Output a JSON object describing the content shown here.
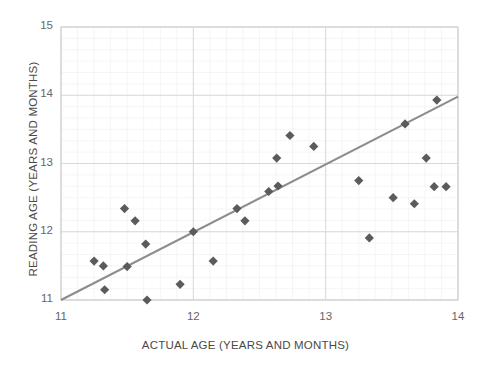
{
  "chart_data": {
    "type": "scatter",
    "title": "",
    "xlabel": "ACTUAL AGE (YEARS AND MONTHS)",
    "ylabel": "READING AGE (YEARS AND MONTHS)",
    "xlim": [
      11,
      14
    ],
    "ylim": [
      11,
      15
    ],
    "xticks": [
      "11",
      "12",
      "13",
      "14"
    ],
    "yticks": [
      "11",
      "12",
      "13",
      "14",
      "15"
    ],
    "xtick_values": [
      11,
      12,
      13,
      14
    ],
    "ytick_values": [
      11,
      12,
      13,
      14,
      15
    ],
    "grid": true,
    "minor_grid": true,
    "legend": "none",
    "marker": "diamond",
    "marker_color": "#5b5b5b",
    "trendline_color": "#8c8c8c",
    "gridline_color": "#d9d9d9",
    "minor_gridline_color": "#f0f0f0",
    "points": [
      {
        "x": 11.25,
        "y": 11.57
      },
      {
        "x": 11.32,
        "y": 11.5
      },
      {
        "x": 11.33,
        "y": 11.15
      },
      {
        "x": 11.48,
        "y": 12.34
      },
      {
        "x": 11.5,
        "y": 11.49
      },
      {
        "x": 11.56,
        "y": 12.16
      },
      {
        "x": 11.64,
        "y": 11.82
      },
      {
        "x": 11.65,
        "y": 11.0
      },
      {
        "x": 11.9,
        "y": 11.23
      },
      {
        "x": 12.0,
        "y": 12.0
      },
      {
        "x": 12.15,
        "y": 11.57
      },
      {
        "x": 12.33,
        "y": 12.34
      },
      {
        "x": 12.39,
        "y": 12.16
      },
      {
        "x": 12.57,
        "y": 12.59
      },
      {
        "x": 12.64,
        "y": 12.67
      },
      {
        "x": 12.63,
        "y": 13.08
      },
      {
        "x": 12.73,
        "y": 13.41
      },
      {
        "x": 12.91,
        "y": 13.25
      },
      {
        "x": 13.25,
        "y": 12.75
      },
      {
        "x": 13.33,
        "y": 11.91
      },
      {
        "x": 13.51,
        "y": 12.5
      },
      {
        "x": 13.6,
        "y": 13.58
      },
      {
        "x": 13.67,
        "y": 12.41
      },
      {
        "x": 13.76,
        "y": 13.08
      },
      {
        "x": 13.82,
        "y": 12.66
      },
      {
        "x": 13.84,
        "y": 13.93
      },
      {
        "x": 13.91,
        "y": 12.66
      }
    ],
    "trendline": {
      "x0": 11.0,
      "y0": 11.0,
      "x1": 14.0,
      "y1": 13.98
    }
  }
}
